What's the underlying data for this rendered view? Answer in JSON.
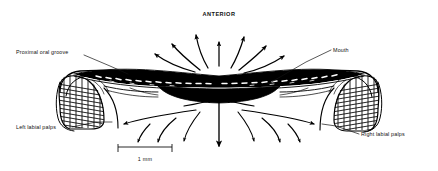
{
  "figure": {
    "title": "ANTERIOR",
    "background_color": "#ffffff",
    "ink_color": "#000000",
    "width": 438,
    "height": 171
  },
  "labels": [
    {
      "id": "anterior",
      "text": "ANTERIOR",
      "name": "anterior-label",
      "x": 219,
      "y": 16,
      "anchor": "middle"
    },
    {
      "id": "proximal_oral_groove",
      "text": "Proximal oral groove",
      "name": "proximal-oral-groove-label",
      "x": 16,
      "y": 54,
      "anchor": "start"
    },
    {
      "id": "mouth",
      "text": "Mouth",
      "name": "mouth-label",
      "x": 333,
      "y": 52,
      "anchor": "start"
    },
    {
      "id": "left_labial_palps",
      "text": "Left labial palps",
      "name": "left-labial-palps-label",
      "x": 16,
      "y": 129,
      "anchor": "start"
    },
    {
      "id": "right_labial_palps",
      "text": "Right labial palps",
      "name": "right-labial-palps-label",
      "x": 361,
      "y": 136,
      "anchor": "start"
    }
  ],
  "scale_bar": {
    "text": "1 mm",
    "name": "scale-bar",
    "x1": 118,
    "x2": 172,
    "y": 147,
    "tick_height": 5,
    "label_x": 145,
    "label_y": 160
  },
  "flow": {
    "description": "Water and particle flow arrows radiating away from the mouth",
    "upper_arrow_count": 7,
    "lower_arrow_count": 11
  },
  "anatomy": {
    "mouth_region": "dark solid lens-shaped mouth aperture at centre",
    "left_palp": "hatched striated left labial palp",
    "right_palp": "hatched striated right labial palp",
    "oral_groove": "proximal oral groove band running across the centre"
  }
}
